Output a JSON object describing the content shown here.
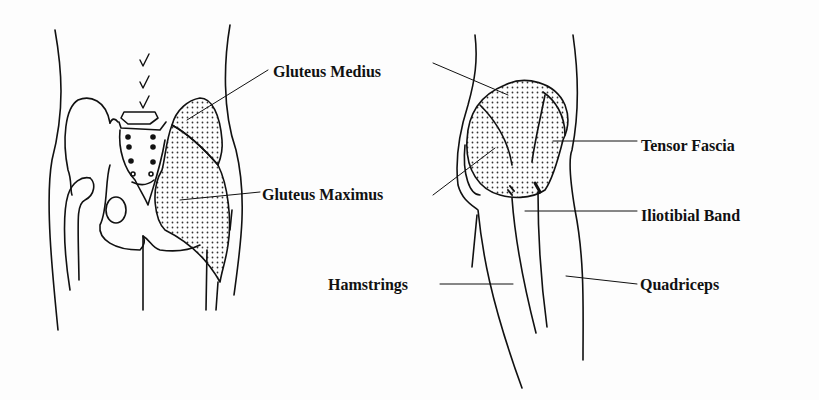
{
  "figure": {
    "type": "anatomical-diagram",
    "panels": [
      {
        "name": "posterior-pelvis-view",
        "description": "Rear view of pelvis and hips with shaded gluteal muscles"
      },
      {
        "name": "lateral-hip-view",
        "description": "Side view of hip and thigh with shaded muscles"
      }
    ],
    "colors": {
      "ink": "#111111",
      "background": "#fdfdfd",
      "stipple": "#333333"
    }
  },
  "labels": {
    "gluteus_medius": "Gluteus Medius",
    "gluteus_maximus": "Gluteus Maximus",
    "tensor_fascia": "Tensor Fascia",
    "iliotibial_band": "Iliotibial Band",
    "hamstrings": "Hamstrings",
    "quadriceps": "Quadriceps"
  }
}
